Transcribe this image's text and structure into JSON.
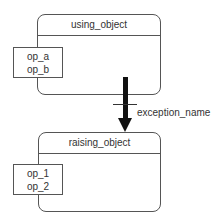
{
  "diagram": {
    "objects": [
      {
        "name": "using_object",
        "operations": [
          "op_a",
          "op_b"
        ]
      },
      {
        "name": "raising_object",
        "operations": [
          "op_1",
          "op_2"
        ]
      }
    ],
    "relation": {
      "from": "raising_object",
      "to": "using_object",
      "type": "exception",
      "label": "exception_name"
    }
  }
}
